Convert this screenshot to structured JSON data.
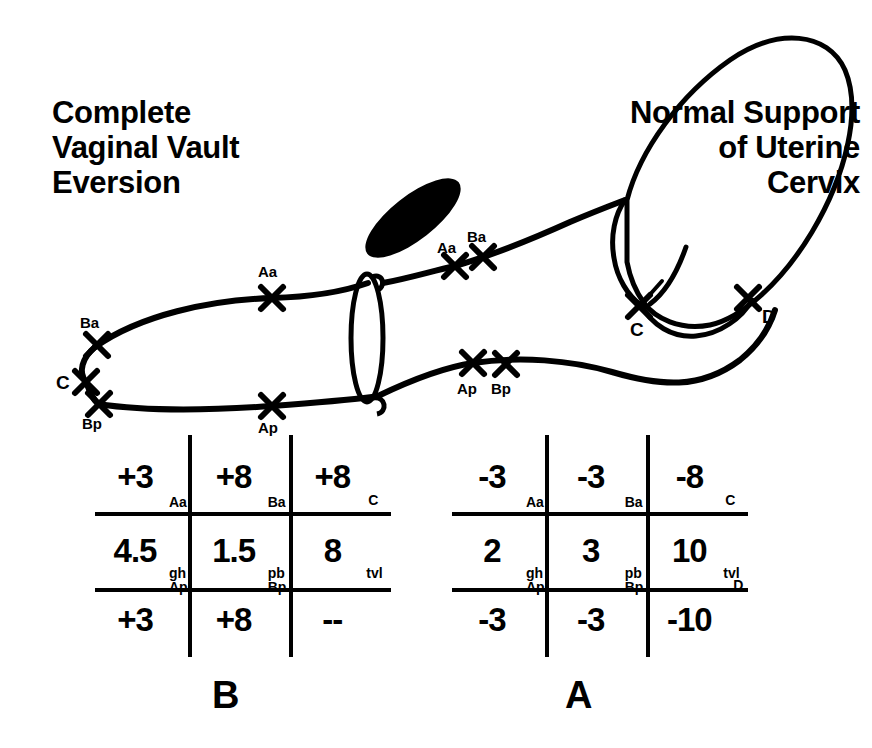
{
  "figure": {
    "caption_left": "Complete\nVaginal Vault\nEversion",
    "caption_right": "Normal Support\nof Uterine\nCervix",
    "panel_left_letter": "B",
    "panel_right_letter": "A",
    "ink_color": "#000000",
    "background_color": "#ffffff"
  },
  "anatomy": {
    "pubic_symphysis_label": "pubic-symphysis",
    "hymenal_ring_label": "hymenal-ring",
    "uterus_label": "uterus",
    "prolapsed_vault_label": "everted-vaginal-vault"
  },
  "markers_prolapsed": [
    {
      "id": "Ba",
      "label": "Ba",
      "x": 97,
      "y": 345,
      "label_x": 80,
      "label_y": 315
    },
    {
      "id": "C",
      "label": "C",
      "x": 86,
      "y": 382,
      "label_x": 56,
      "label_y": 375
    },
    {
      "id": "Bp",
      "label": "Bp",
      "x": 99,
      "y": 404,
      "label_x": 82,
      "label_y": 416
    },
    {
      "id": "Aa",
      "label": "Aa",
      "x": 272,
      "y": 298,
      "label_x": 258,
      "label_y": 264
    },
    {
      "id": "Ap",
      "label": "Ap",
      "x": 272,
      "y": 406,
      "label_x": 258,
      "label_y": 420
    }
  ],
  "markers_normal": [
    {
      "id": "Aa",
      "label": "Aa",
      "x": 455,
      "y": 266,
      "label_x": 437,
      "label_y": 240
    },
    {
      "id": "Ba",
      "label": "Ba",
      "x": 483,
      "y": 257,
      "label_x": 467,
      "label_y": 229
    },
    {
      "id": "Ap",
      "label": "Ap",
      "x": 473,
      "y": 363,
      "label_x": 457,
      "label_y": 381
    },
    {
      "id": "Bp",
      "label": "Bp",
      "x": 506,
      "y": 364,
      "label_x": 491,
      "label_y": 381
    },
    {
      "id": "C",
      "label": "C",
      "x": 639,
      "y": 306,
      "label_x": 630,
      "label_y": 322
    },
    {
      "id": "D",
      "label": "D",
      "x": 748,
      "y": 298,
      "label_x": 762,
      "label_y": 309
    }
  ],
  "grid_b": {
    "name": "POP-Q grid B",
    "rows": [
      [
        {
          "value": "+3",
          "sub": "Aa"
        },
        {
          "value": "+8",
          "sub": "Ba"
        },
        {
          "value": "+8",
          "sub": "C"
        }
      ],
      [
        {
          "value": "4.5",
          "sub": "gh"
        },
        {
          "value": "1.5",
          "sub": "pb"
        },
        {
          "value": "8",
          "sub": "tvl"
        }
      ],
      [
        {
          "value": "+3",
          "sub": "Ap"
        },
        {
          "value": "+8",
          "sub": "Bp"
        },
        {
          "value": "--",
          "sub": ""
        }
      ]
    ]
  },
  "grid_a": {
    "name": "POP-Q grid A",
    "rows": [
      [
        {
          "value": "-3",
          "sub": "Aa"
        },
        {
          "value": "-3",
          "sub": "Ba"
        },
        {
          "value": "-8",
          "sub": "C"
        }
      ],
      [
        {
          "value": "2",
          "sub": "gh"
        },
        {
          "value": "3",
          "sub": "pb"
        },
        {
          "value": "10",
          "sub": "tvl"
        }
      ],
      [
        {
          "value": "-3",
          "sub": "Ap"
        },
        {
          "value": "-3",
          "sub": "Bp"
        },
        {
          "value": "-10",
          "sub": "D"
        }
      ]
    ]
  }
}
